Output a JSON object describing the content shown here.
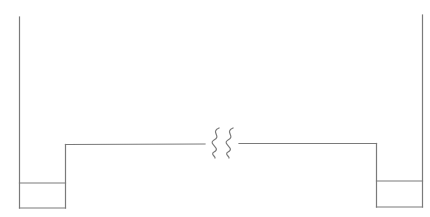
{
  "diagram": {
    "type": "line-drawing",
    "stroke_color": "#7a7a7a",
    "background": "#ffffff",
    "left_wall": {
      "x": 19.5,
      "y_top": 17,
      "y_bottom": 208
    },
    "left_box": {
      "x1": 19.5,
      "x2": 65.5,
      "y_top": 183,
      "y_bottom": 208
    },
    "left_step": {
      "x": 65.5,
      "y_top": 144,
      "y_bottom": 208
    },
    "span_left": {
      "x1": 65.5,
      "x2": 205,
      "y": 144.5
    },
    "break_symbol": {
      "type": "double-wavy-break",
      "x_positions": [
        216,
        230
      ],
      "y_top": 128,
      "y_bottom": 158
    },
    "span_right": {
      "x1": 239,
      "x2": 376.5,
      "y": 143.5
    },
    "right_step": {
      "x": 376.5,
      "y_top": 143,
      "y_bottom": 207
    },
    "right_box": {
      "x1": 376.5,
      "x2": 422.5,
      "y_top": 181,
      "y_bottom": 207
    },
    "right_wall": {
      "x": 422.5,
      "y_top": 15,
      "y_bottom": 207
    }
  }
}
